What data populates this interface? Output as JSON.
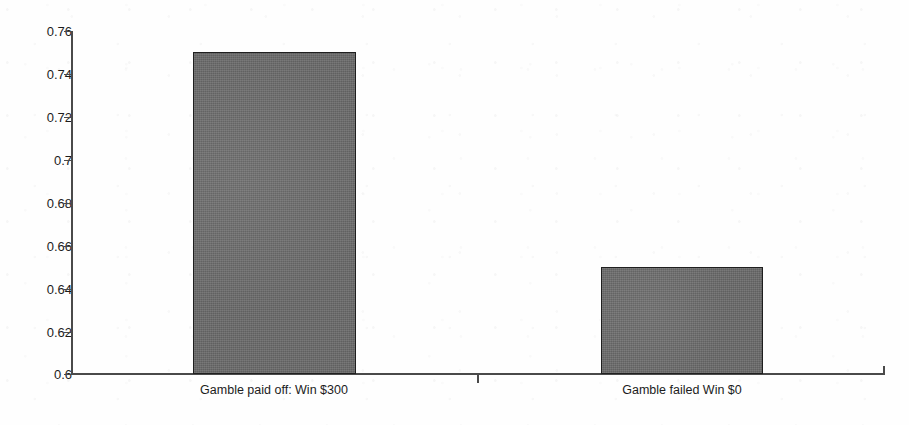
{
  "chart_data": {
    "type": "bar",
    "title": "",
    "subtitle": "",
    "xlabel": "",
    "ylabel": "",
    "categories": [
      "Gamble paid off: Win $300",
      "Gamble failed Win $0"
    ],
    "values": [
      0.75,
      0.65
    ],
    "series": [
      {
        "name": "",
        "values": [
          0.75,
          0.65
        ]
      }
    ],
    "ylim": [
      0.6,
      0.76
    ],
    "ytick_labels": [
      "0.76",
      "0.74",
      "0.72",
      "0.7",
      "0.68",
      "0.66",
      "0.64",
      "0.62",
      "0.6"
    ],
    "ytick_values": [
      0.76,
      0.74,
      0.72,
      0.7,
      0.68,
      0.66,
      0.64,
      0.62,
      0.6
    ],
    "ytick_step": 0.02,
    "grid": false,
    "legend": false,
    "legend_position": "none",
    "annotations": [],
    "colors": {
      "bar_fill": "#6b6b6b",
      "bar_border": "#1f1f1f",
      "axis": "#4a4a4a",
      "text": "#1c1c1c",
      "background": "#ffffff"
    }
  },
  "axes": {
    "y": {
      "ticks": [
        {
          "label": "0.76",
          "value": 0.76
        },
        {
          "label": "0.74",
          "value": 0.74
        },
        {
          "label": "0.72",
          "value": 0.72
        },
        {
          "label": "0.7",
          "value": 0.7
        },
        {
          "label": "0.68",
          "value": 0.68
        },
        {
          "label": "0.66",
          "value": 0.66
        },
        {
          "label": "0.64",
          "value": 0.64
        },
        {
          "label": "0.62",
          "value": 0.62
        },
        {
          "label": "0.6",
          "value": 0.6
        }
      ]
    },
    "x": {
      "categories": [
        {
          "label": "Gamble paid off: Win $300"
        },
        {
          "label": "Gamble failed Win $0"
        }
      ]
    }
  }
}
